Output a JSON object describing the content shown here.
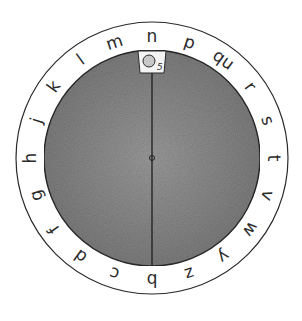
{
  "wheel": {
    "center": [
      152,
      158
    ],
    "outer_radius": 136,
    "inner_radius": 108,
    "letter_radius": 122,
    "disc_color": "#8f8f8f",
    "ring_color": "#ffffff",
    "line_color": "#2a2a2a",
    "letters": [
      "n",
      "p",
      "qu",
      "r",
      "s",
      "t",
      "v",
      "w",
      "y",
      "z",
      "b",
      "c",
      "d",
      "f",
      "g",
      "h",
      "j",
      "k",
      "l",
      "m"
    ],
    "window_label": "5",
    "pointer_letter": "n"
  }
}
